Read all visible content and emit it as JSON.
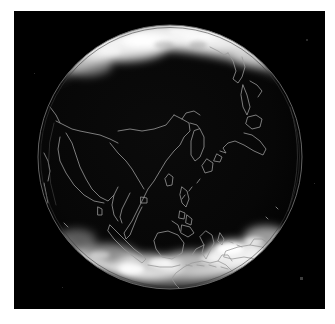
{
  "view": {
    "background_color": "#ffffff",
    "plate_color": "#000000",
    "plate": {
      "x": 14,
      "y": 11,
      "width": 311,
      "height": 298
    }
  },
  "globe": {
    "projection": "orthographic",
    "center": {
      "x": 156,
      "y": 146
    },
    "radius": 132,
    "limb_color": "#6e6e6e",
    "disc_color": "#050505",
    "coastline_color": "#9a9a9a",
    "cloud_color": "#ffffff",
    "sub_point_label": "Southeast Asia / Western Pacific",
    "center_longitude_deg": 125,
    "center_latitude_deg": 5
  },
  "features": {
    "polar_bands": [
      {
        "name": "north-polar-cloud-band",
        "hemisphere": "north",
        "brightness": 0.92
      },
      {
        "name": "south-polar-cloud-band",
        "hemisphere": "south",
        "brightness": 0.95
      }
    ],
    "landmasses": [
      "Japan",
      "Korean Peninsula",
      "China",
      "Southeast Asia",
      "Philippines",
      "Borneo",
      "Sumatra",
      "Java",
      "Sulawesi",
      "New Guinea",
      "Australia",
      "India",
      "Kamchatka"
    ]
  },
  "labels": {
    "image_title": "",
    "caption": ""
  }
}
